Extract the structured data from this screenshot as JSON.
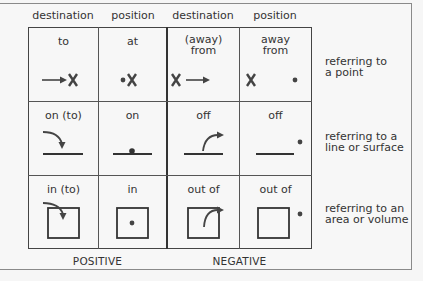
{
  "column_headers": [
    "destination",
    "position",
    "destination",
    "position"
  ],
  "rows": [
    {
      "side_label": [
        "referring to",
        "a point"
      ],
      "cells": [
        {
          "label": [
            "to"
          ],
          "icon": "arrow-to-x-icon"
        },
        {
          "label": [
            "at"
          ],
          "icon": "dot-at-x-icon"
        },
        {
          "label": [
            "(away)",
            "from"
          ],
          "icon": "x-arrow-away-icon"
        },
        {
          "label": [
            "away",
            "from"
          ],
          "icon": "x-dot-apart-icon"
        }
      ]
    },
    {
      "side_label": [
        "referring to a",
        "line or surface"
      ],
      "cells": [
        {
          "label": [
            "on (to)"
          ],
          "icon": "curved-arrow-onto-line-icon"
        },
        {
          "label": [
            "on"
          ],
          "icon": "dot-on-line-icon"
        },
        {
          "label": [
            "off"
          ],
          "icon": "curved-arrow-off-line-icon"
        },
        {
          "label": [
            "off"
          ],
          "icon": "line-dot-off-icon"
        }
      ]
    },
    {
      "side_label": [
        "referring to an",
        "area or volume"
      ],
      "cells": [
        {
          "label": [
            "in (to)"
          ],
          "icon": "curved-arrow-into-box-icon"
        },
        {
          "label": [
            "in"
          ],
          "icon": "dot-in-box-icon"
        },
        {
          "label": [
            "out of"
          ],
          "icon": "curved-arrow-out-of-box-icon"
        },
        {
          "label": [
            "out of"
          ],
          "icon": "box-dot-outside-icon"
        }
      ]
    }
  ],
  "footer": {
    "positive": "POSITIVE",
    "negative": "NEGATIVE"
  }
}
